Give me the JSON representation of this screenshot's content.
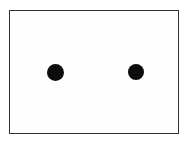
{
  "diagram": {
    "frame": {
      "x": 9,
      "y": 10,
      "width": 168,
      "height": 122,
      "border_color": "#333333",
      "fill_color": "#fefefe"
    },
    "dots": [
      {
        "id": "left",
        "cx": 55,
        "cy": 72,
        "r": 8.5,
        "color": "#0c0c0c"
      },
      {
        "id": "right",
        "cx": 136,
        "cy": 72,
        "r": 8,
        "color": "#0c0c0c"
      }
    ]
  }
}
